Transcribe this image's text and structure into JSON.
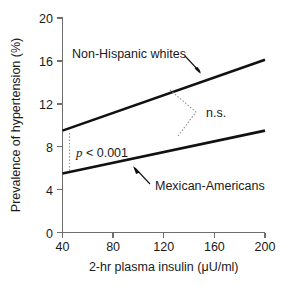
{
  "chart_data": {
    "type": "line",
    "title": "",
    "xlabel": "2-hr plasma insulin (μU/ml)",
    "ylabel": "Prevalence of hypertension (%)",
    "xlim": [
      40,
      200
    ],
    "ylim": [
      0,
      20
    ],
    "xticks": [
      40,
      80,
      120,
      160,
      200
    ],
    "yticks": [
      0,
      4,
      8,
      12,
      16,
      20
    ],
    "xtick_labels": [
      "40",
      "80",
      "120",
      "160",
      "200"
    ],
    "ytick_labels": [
      "0",
      "4",
      "8",
      "12",
      "16",
      "20"
    ],
    "grid": false,
    "legend_position": "inline-annotations",
    "series": [
      {
        "name": "Non-Hispanic whites",
        "x": [
          40,
          200
        ],
        "values": [
          9.5,
          16.1
        ]
      },
      {
        "name": "Mexican-Americans",
        "x": [
          40,
          200
        ],
        "values": [
          5.5,
          9.5
        ]
      }
    ],
    "annotations": [
      {
        "id": "p-value",
        "text_italic": "p",
        "text_rest": " < 0.001",
        "full_text": "p < 0.001",
        "at_x": 43,
        "between_series": [
          "Non-Hispanic whites",
          "Mexican-Americans"
        ],
        "style": "dotted-vertical-bracket"
      },
      {
        "id": "n-s",
        "full_text": "n.s.",
        "at_x": 160,
        "between_series": [
          "Non-Hispanic whites",
          "Mexican-Americans"
        ],
        "style": "dotted-angle-bracket"
      }
    ],
    "series_callouts": [
      {
        "label": "Non-Hispanic whites",
        "points_to_series": "Non-Hispanic whites",
        "arrow_direction": "down-right"
      },
      {
        "label": "Mexican-Americans",
        "points_to_series": "Mexican-Americans",
        "arrow_direction": "up-left"
      }
    ]
  },
  "labels": {
    "ylabel": "Prevalence of hypertension (%)",
    "xlabel": "2-hr plasma insulin (μU/ml)",
    "series_upper": "Non-Hispanic whites",
    "series_lower": "Mexican-Americans",
    "annot_ns": "n.s.",
    "annot_p_italic": "p",
    "annot_p_rest": " < 0.001",
    "y_ticks": {
      "t0": "0",
      "t1": "4",
      "t2": "8",
      "t3": "12",
      "t4": "16",
      "t5": "20"
    },
    "x_ticks": {
      "t0": "40",
      "t1": "80",
      "t2": "120",
      "t3": "160",
      "t4": "200"
    }
  },
  "colors": {
    "background": "#ffffff",
    "series_stroke": "#111111",
    "axis_stroke": "#6e6e6e",
    "annotation_stroke": "#8c8c8c",
    "text": "#1a1a1a"
  }
}
